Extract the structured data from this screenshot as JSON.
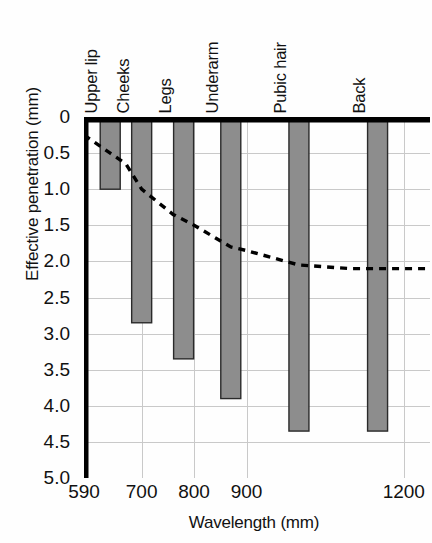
{
  "chart_data": {
    "type": "bar",
    "title": "",
    "subtitle": "",
    "xlabel": "Wavelength (mm)",
    "ylabel": "Effective penetration (mm)",
    "categories": [
      "Upper lip",
      "Cheeks",
      "Legs",
      "Underarm",
      "Pubic hair",
      "Back"
    ],
    "values": [
      1.0,
      2.85,
      3.35,
      3.9,
      4.35,
      4.35
    ],
    "bar_wavelengths": [
      640,
      700,
      780,
      870,
      1000,
      1150
    ],
    "grid": true,
    "legend": "none",
    "y_axis_inverted": true,
    "ylim": [
      0,
      5.0
    ],
    "yticks": [
      0,
      0.5,
      1.0,
      1.5,
      2.0,
      2.5,
      3.0,
      3.5,
      4.0,
      4.5,
      5.0
    ],
    "ytick_labels": [
      "0",
      "0.5",
      "1.0",
      "1.5",
      "2.0",
      "2.5",
      "3.0",
      "3.5",
      "4.0",
      "4.5",
      "5.0"
    ],
    "xticks": [
      590,
      700,
      800,
      900,
      1200
    ],
    "xtick_labels": [
      "590",
      "700",
      "800",
      "900",
      "1200"
    ],
    "xlim": [
      590,
      1250
    ],
    "series": [
      {
        "name": "Effective penetration depth",
        "type": "bar",
        "values": [
          1.0,
          2.85,
          3.35,
          3.9,
          4.35,
          4.35
        ]
      },
      {
        "name": "Penetration trend",
        "type": "line",
        "style": "dashed",
        "x": [
          590,
          640,
          670,
          700,
          760,
          800,
          870,
          900,
          1000,
          1100,
          1200,
          1250
        ],
        "y": [
          0.25,
          0.5,
          0.65,
          1.0,
          1.35,
          1.5,
          1.8,
          1.85,
          2.05,
          2.1,
          2.1,
          2.1
        ]
      }
    ]
  },
  "axes": {
    "y_title": "Effective penetration (mm)",
    "x_title": "Wavelength (mm)"
  },
  "colors": {
    "bar_fill": "#8d8d8d",
    "bar_stroke": "#2a2a2a",
    "grid": "#c9c9c9",
    "axis": "#000000",
    "trendline": "#000000",
    "background": "#fefefe"
  }
}
